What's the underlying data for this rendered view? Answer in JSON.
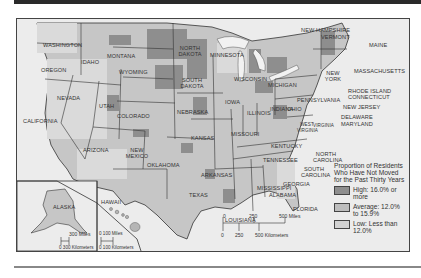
{
  "map": {
    "title": "Proportion of Residents Who Have Not Moved for the Past Thirty Years",
    "legend": {
      "title": "Proportion of Residents Who Have Not Moved for the Past Thirty Years",
      "items": [
        {
          "label": "High: 16.0% or more",
          "color": "#8e8e8e"
        },
        {
          "label": "Average: 12.0% to 15.9%",
          "color": "#bdbdbd"
        },
        {
          "label": "Low: Less than 12.0%",
          "color": "#d2d2d2"
        }
      ]
    },
    "states": {
      "washington": "WASHINGTON",
      "oregon": "OREGON",
      "california": "CALIFORNIA",
      "nevada": "NEVADA",
      "idaho": "IDAHO",
      "montana": "MONTANA",
      "wyoming": "WYOMING",
      "utah": "UTAH",
      "colorado": "COLORADO",
      "arizona": "ARIZONA",
      "new_mexico": "NEW MEXICO",
      "north_dakota": "NORTH DAKOTA",
      "south_dakota": "SOUTH DAKOTA",
      "nebraska": "NEBRASKA",
      "kansas": "KANSAS",
      "oklahoma": "OKLAHOMA",
      "texas": "TEXAS",
      "minnesota": "MINNESOTA",
      "iowa": "IOWA",
      "missouri": "MISSOURI",
      "arkansas": "ARKANSAS",
      "louisiana": "LOUISIANA",
      "wisconsin": "WISCONSIN",
      "illinois": "ILLINOIS",
      "michigan": "MICHIGAN",
      "indiana": "INDIANA",
      "ohio": "OHIO",
      "kentucky": "KENTUCKY",
      "tennessee": "TENNESSEE",
      "mississippi": "MISSISSIPPI",
      "alabama": "ALABAMA",
      "georgia": "GEORGIA",
      "florida": "FLORIDA",
      "south_carolina": "SOUTH CAROLINA",
      "north_carolina": "NORTH CAROLINA",
      "virginia": "VIRGINIA",
      "west_virginia": "WEST VIRGINIA",
      "pennsylvania": "PENNSYLVANIA",
      "new_york": "NEW YORK",
      "new_jersey": "NEW JERSEY",
      "delaware": "DELAWARE",
      "maryland": "MARYLAND",
      "connecticut": "CONNECTICUT",
      "rhode_island": "RHODE ISLAND",
      "massachusetts": "MASSACHUSETTS",
      "vermont": "VERMONT",
      "new_hampshire": "NEW HAMPSHIRE",
      "maine": "MAINE",
      "alaska": "ALASKA",
      "hawaii": "HAWAII"
    },
    "scale_main": {
      "miles": [
        "0",
        "250",
        "500 Miles"
      ],
      "km": [
        "0",
        "250",
        "500 Kilometers"
      ]
    },
    "scale_alaska": {
      "miles": "300 Miles",
      "km": "0 300 Kilometers"
    },
    "scale_hawaii": {
      "miles": "0  100 Miles",
      "km": "0  100 Kilometers"
    }
  }
}
